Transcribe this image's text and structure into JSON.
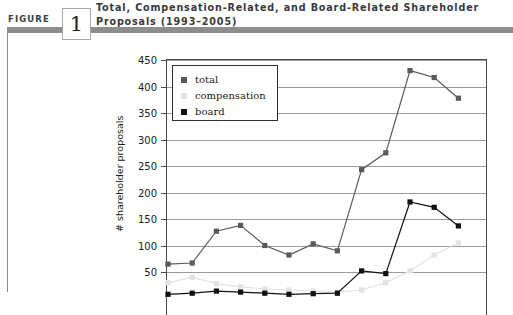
{
  "figure": {
    "label": "FIGURE",
    "number": "1",
    "title": "Total, Compensation-Related, and Board-Related Shareholder Proposals (1993–2005)"
  },
  "legend": {
    "position": "top-left-inside",
    "entries": [
      {
        "name": "total",
        "label": "total",
        "color": "#5a5a5a"
      },
      {
        "name": "compensation",
        "label": "compensation",
        "color": "#e2e2e2"
      },
      {
        "name": "board",
        "label": "board",
        "color": "#111111"
      }
    ]
  },
  "chart_data": {
    "type": "line",
    "title": "Total, Compensation-Related, and Board-Related Shareholder Proposals (1993–2005)",
    "xlabel": "",
    "ylabel": "# shareholder proposals",
    "x": [
      1993,
      1994,
      1995,
      1996,
      1997,
      1998,
      1999,
      2000,
      2001,
      2002,
      2003,
      2004,
      2005
    ],
    "categories": [
      "1993",
      "1994",
      "1995",
      "1996",
      "1997",
      "1998",
      "1999",
      "2000",
      "2001",
      "2002",
      "2003",
      "2004",
      "2005"
    ],
    "yticks": [
      50,
      100,
      150,
      200,
      250,
      300,
      350,
      400,
      450
    ],
    "ytick_labels": [
      "50",
      "100",
      "150",
      "200",
      "250",
      "300",
      "350",
      "400",
      "450"
    ],
    "ylim": [
      0,
      450
    ],
    "grid": true,
    "series": [
      {
        "name": "total",
        "label": "total",
        "color": "#5a5a5a",
        "marker": "square",
        "values": [
          65,
          67,
          127,
          138,
          100,
          82,
          103,
          90,
          243,
          275,
          430,
          417,
          378
        ]
      },
      {
        "name": "compensation",
        "label": "compensation",
        "color": "#e2e2e2",
        "marker": "square",
        "values": [
          30,
          40,
          28,
          22,
          18,
          16,
          14,
          12,
          16,
          30,
          52,
          82,
          105
        ]
      },
      {
        "name": "board",
        "label": "board",
        "color": "#111111",
        "marker": "square",
        "values": [
          8,
          10,
          14,
          12,
          10,
          8,
          9,
          10,
          52,
          47,
          182,
          172,
          137
        ]
      }
    ]
  },
  "colors": {
    "rule": "#8d8d8d",
    "axis": "#4a4a4a",
    "gridline": "#9a9a9a",
    "text": "#1a1a1a",
    "title_text": "#3a3a3a"
  }
}
